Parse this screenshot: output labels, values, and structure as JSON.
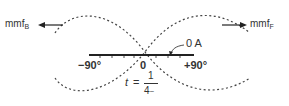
{
  "diagram": {
    "left_label": {
      "main": "mmf",
      "sub": "B"
    },
    "right_label": {
      "main": "mmf",
      "sub": "F"
    },
    "current_label": "0 A",
    "axis": {
      "left_tick": "−90°",
      "center_tick": "0",
      "right_tick": "+90°"
    },
    "time_label": {
      "var": "t",
      "equals": "=",
      "numerator": "1",
      "denominator": "4",
      "denominator_suffix": "~"
    },
    "colors": {
      "line": "#222222",
      "dashed": "#444444"
    }
  }
}
